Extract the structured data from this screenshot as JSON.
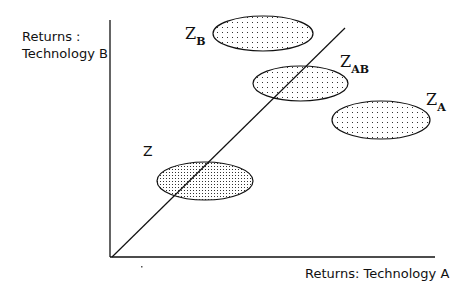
{
  "diagram": {
    "y_axis_label_line1": "Returns :",
    "y_axis_label_line2": "Technology B",
    "x_axis_label": "Returns: Technology A",
    "regions": [
      {
        "id": "Z",
        "label": "Z",
        "subscript": "",
        "fill": "dense-dots"
      },
      {
        "id": "ZB",
        "label": "Z",
        "subscript": "B",
        "fill": "sparse-dots"
      },
      {
        "id": "ZAB",
        "label": "Z",
        "subscript": "AB",
        "fill": "sparse-dots"
      },
      {
        "id": "ZA",
        "label": "Z",
        "subscript": "A",
        "fill": "sparse-dots"
      }
    ],
    "diagonal": "45-degree line from origin"
  }
}
